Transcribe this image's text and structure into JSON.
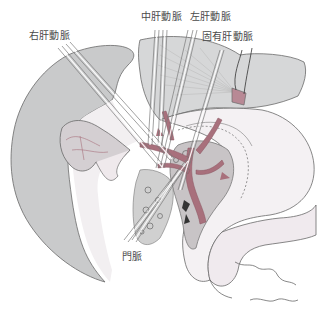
{
  "figure": {
    "colors": {
      "liver_gray": "#c9cacb",
      "liver_dark": "#bdbebf",
      "organ_light": "#ece8ea",
      "organ_white": "#f4f1f3",
      "pancreas_gray": "#c8c4c6",
      "vessel_pink": "#a8707c",
      "vessel_dark": "#8a5560",
      "outline": "#6a6a6a",
      "label_text": "#4a4a4a"
    }
  },
  "labels": {
    "right_hepatic_artery": "右肝動脈",
    "middle_hepatic_artery": "中肝動脈",
    "left_hepatic_artery": "左肝動脈",
    "proper_hepatic_artery": "固有肝動脈",
    "portal_vein": "門脈"
  }
}
